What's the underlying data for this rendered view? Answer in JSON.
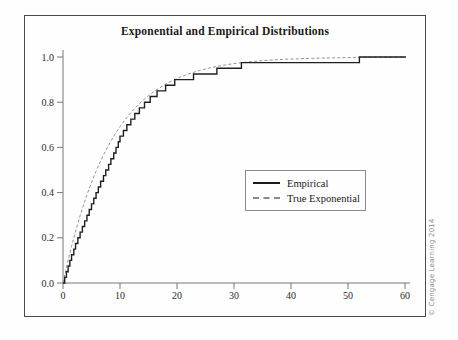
{
  "figure": {
    "title": "Exponential and Empirical Distributions",
    "credit": "© Cengage Learning 2014"
  },
  "legend": {
    "items": [
      {
        "label": "Empirical",
        "style": "solid",
        "color": "#1a1a1a"
      },
      {
        "label": "True Exponential",
        "style": "dashed",
        "color": "#8a8a8a"
      }
    ]
  },
  "chart_data": {
    "type": "line",
    "title": "Exponential and Empirical Distributions",
    "xlabel": "",
    "ylabel": "",
    "xlim": [
      0,
      60
    ],
    "ylim": [
      0.0,
      1.0
    ],
    "x_ticks": [
      "0",
      "10",
      "20",
      "30",
      "40",
      "50",
      "60"
    ],
    "y_ticks": [
      "0.0",
      "0.2",
      "0.4",
      "0.6",
      "0.8",
      "1.0"
    ],
    "grid": false,
    "legend_position": "inside-right-middle",
    "series": [
      {
        "name": "Empirical",
        "kind": "empirical-step-cdf",
        "color": "#1f1f1f",
        "n": 40,
        "sample_sorted": [
          0.3,
          0.6,
          0.9,
          1.2,
          1.5,
          1.9,
          2.2,
          2.6,
          3.0,
          3.4,
          3.8,
          4.2,
          4.6,
          5.0,
          5.4,
          5.8,
          6.2,
          6.6,
          7.1,
          7.5,
          8.0,
          8.4,
          8.9,
          9.3,
          9.7,
          10.0,
          10.6,
          11.2,
          11.9,
          12.6,
          13.4,
          14.3,
          15.3,
          16.5,
          18.0,
          19.6,
          22.9,
          27.0,
          31.3,
          52.0
        ]
      },
      {
        "name": "True Exponential",
        "kind": "exponential-cdf",
        "color": "#909090",
        "mean": 8.5,
        "dash": "3 2.2",
        "formula": "F(x) = 1 - exp(-x/8.5)"
      }
    ]
  }
}
